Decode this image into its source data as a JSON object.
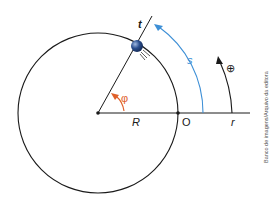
{
  "diagram": {
    "labels": {
      "t": "t",
      "s": "s",
      "phi": "φ",
      "R": "R",
      "O": "O",
      "r": "r",
      "positive_direction": "⊕"
    },
    "credit": "Banco de imagens/Arquivo da editora",
    "colors": {
      "line": "#1a1a1a",
      "arc_s": "#3d8fd6",
      "angle": "#e0602a",
      "ball": "#2b4f8f"
    }
  }
}
